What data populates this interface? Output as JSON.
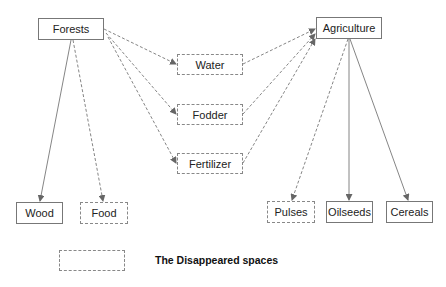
{
  "diagram": {
    "nodes": [
      {
        "id": "forests",
        "label": "Forests",
        "style": "solid",
        "x": 38,
        "y": 18,
        "w": 66,
        "h": 22
      },
      {
        "id": "agriculture",
        "label": "Agriculture",
        "style": "solid",
        "x": 316,
        "y": 17,
        "w": 66,
        "h": 22
      },
      {
        "id": "water",
        "label": "Water",
        "style": "dashed",
        "x": 177,
        "y": 54,
        "w": 66,
        "h": 21
      },
      {
        "id": "fodder",
        "label": "Fodder",
        "style": "dashed",
        "x": 177,
        "y": 104,
        "w": 66,
        "h": 21
      },
      {
        "id": "fertilizer",
        "label": "Fertilizer",
        "style": "dashed",
        "x": 177,
        "y": 153,
        "w": 66,
        "h": 21
      },
      {
        "id": "wood",
        "label": "Wood",
        "style": "solid",
        "x": 16,
        "y": 202,
        "w": 47,
        "h": 22
      },
      {
        "id": "food",
        "label": "Food",
        "style": "dashed",
        "x": 80,
        "y": 202,
        "w": 48,
        "h": 22
      },
      {
        "id": "pulses",
        "label": "Pulses",
        "style": "dashed",
        "x": 267,
        "y": 201,
        "w": 48,
        "h": 22
      },
      {
        "id": "oilseeds",
        "label": "Oilseeds",
        "style": "solid",
        "x": 326,
        "y": 201,
        "w": 47,
        "h": 22
      },
      {
        "id": "cereals",
        "label": "Cereals",
        "style": "solid",
        "x": 386,
        "y": 201,
        "w": 47,
        "h": 22
      }
    ],
    "edges": [
      {
        "from": "forests",
        "to": "water",
        "style": "dashed"
      },
      {
        "from": "forests",
        "to": "fodder",
        "style": "dashed"
      },
      {
        "from": "forests",
        "to": "fertilizer",
        "style": "dashed"
      },
      {
        "from": "forests",
        "to": "wood",
        "style": "solid"
      },
      {
        "from": "forests",
        "to": "food",
        "style": "dashed"
      },
      {
        "from": "water",
        "to": "agriculture",
        "style": "dashed"
      },
      {
        "from": "fodder",
        "to": "agriculture",
        "style": "dashed"
      },
      {
        "from": "fertilizer",
        "to": "agriculture",
        "style": "dashed"
      },
      {
        "from": "agriculture",
        "to": "pulses",
        "style": "dashed"
      },
      {
        "from": "agriculture",
        "to": "oilseeds",
        "style": "solid"
      },
      {
        "from": "agriculture",
        "to": "cereals",
        "style": "solid"
      }
    ],
    "legend": {
      "label": "The Disappeared spaces",
      "box_style": "dashed"
    }
  },
  "colors": {
    "line": "#777777",
    "text": "#222222",
    "background": "#ffffff"
  }
}
